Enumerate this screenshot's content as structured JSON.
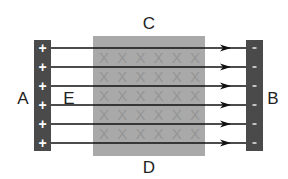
{
  "diagram": {
    "labels": {
      "top": "C",
      "bottom": "D",
      "left_plate": "A",
      "right_plate": "B",
      "field": "E"
    },
    "left_plate": {
      "sign": "+",
      "charges": 6,
      "color": "#4a4a4a"
    },
    "right_plate": {
      "sign": "-",
      "charges": 6,
      "color": "#4a4a4a"
    },
    "magnetic_region": {
      "color": "#a9a9a9",
      "mark": "X",
      "mark_color": "#959595",
      "rows": 5,
      "cols": 6
    },
    "field_lines": {
      "count": 6,
      "direction": "left-to-right",
      "color": "#111111"
    }
  }
}
